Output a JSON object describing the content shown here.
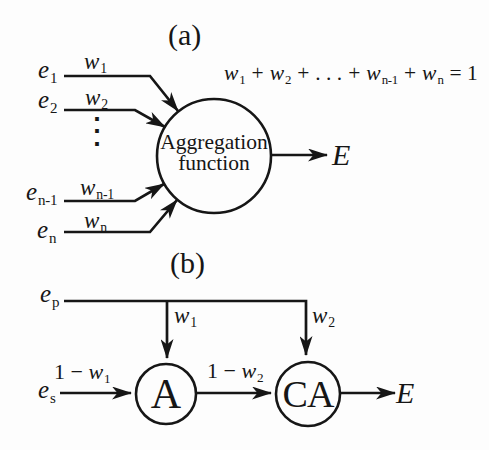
{
  "figure": {
    "colors": {
      "ink": "#161616",
      "background": "#fdfdfd"
    },
    "panel_a": {
      "tag": "(a)",
      "inputs": [
        {
          "base": "e",
          "sub": "1",
          "wbase": "w",
          "wsub": "1"
        },
        {
          "base": "e",
          "sub": "2",
          "wbase": "w",
          "wsub": "2"
        },
        {
          "base": "e",
          "sub": "n-1",
          "wbase": "w",
          "wsub": "n-1"
        },
        {
          "base": "e",
          "sub": "n",
          "wbase": "w",
          "wsub": "n"
        }
      ],
      "ellipsis": "⋮",
      "node": {
        "line1": "Aggregation",
        "line2": "function"
      },
      "equation": {
        "terms": [
          {
            "base": "w",
            "sub": "1"
          },
          {
            "base": "w",
            "sub": "2"
          },
          {
            "base": "w",
            "sub": "n-1"
          },
          {
            "base": "w",
            "sub": "n"
          }
        ],
        "plus": "+",
        "dots": ". . .",
        "equals": "= 1"
      },
      "output": "E"
    },
    "panel_b": {
      "tag": "(b)",
      "input_primary": {
        "base": "e",
        "sub": "p"
      },
      "input_secondary": {
        "base": "e",
        "sub": "s"
      },
      "weight1": {
        "base": "w",
        "sub": "1"
      },
      "weight2": {
        "base": "w",
        "sub": "2"
      },
      "edge_to_a": {
        "prefix": "1 − ",
        "base": "w",
        "sub": "1"
      },
      "edge_to_ca": {
        "prefix": "1 − ",
        "base": "w",
        "sub": "2"
      },
      "node_a": "A",
      "node_ca": "CA",
      "output": "E"
    }
  }
}
